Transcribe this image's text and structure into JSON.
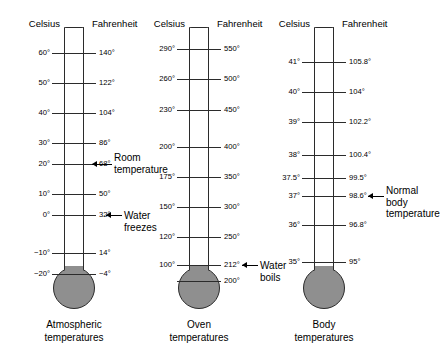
{
  "figure": {
    "colors": {
      "mercury": "#8f8f8f",
      "outline": "#2b2b2b",
      "background": "#ffffff"
    }
  },
  "thermometers": [
    {
      "id": "atmospheric",
      "caption_line1": "Atmospheric",
      "caption_line2": "temperatures",
      "header_celsius": "Celsius",
      "header_fahrenheit": "Fahrenheit",
      "ticks": [
        {
          "c": "60°",
          "f": "140°"
        },
        {
          "c": "50°",
          "f": "122°"
        },
        {
          "c": "40°",
          "f": "104°"
        },
        {
          "c": "30°",
          "f": "86°"
        },
        {
          "c": "20°",
          "f": "68°"
        },
        {
          "c": "10°",
          "f": "50°"
        },
        {
          "c": "0°",
          "f": "32°"
        },
        {
          "c": "−10°",
          "f": "14°"
        },
        {
          "c": "−20°",
          "f": "−4°"
        }
      ],
      "fill_to_tick_index": 6,
      "annotations": [
        {
          "id": "room-temperature",
          "lines": [
            "Room",
            "temperature"
          ],
          "at_tick_index": 4,
          "arrow": "left"
        },
        {
          "id": "water-freezes",
          "lines": [
            "Water",
            "freezes"
          ],
          "at_tick_index": 6,
          "arrow": "left"
        }
      ]
    },
    {
      "id": "oven",
      "caption_line1": "Oven",
      "caption_line2": "temperatures",
      "header_celsius": "Celsius",
      "header_fahrenheit": "Fahrenheit",
      "ticks": [
        {
          "c": "290°",
          "f": "550°"
        },
        {
          "c": "260°",
          "f": "500°"
        },
        {
          "c": "230°",
          "f": "450°"
        },
        {
          "c": "200°",
          "f": "400°"
        },
        {
          "c": "175°",
          "f": "350°"
        },
        {
          "c": "150°",
          "f": "300°"
        },
        {
          "c": "120°",
          "f": "250°"
        },
        {
          "c": "100°",
          "f": "212°"
        },
        {
          "c": "",
          "f": "200°"
        }
      ],
      "fill_to_tick_index": 7,
      "annotations": [
        {
          "id": "water-boils",
          "lines": [
            "Water",
            "boils"
          ],
          "at_tick_index": 7,
          "arrow": "left"
        }
      ]
    },
    {
      "id": "body",
      "caption_line1": "Body",
      "caption_line2": "temperatures",
      "header_celsius": "Celsius",
      "header_fahrenheit": "Fahrenheit",
      "ticks": [
        {
          "c": "41°",
          "f": "105.8°"
        },
        {
          "c": "40°",
          "f": "104°"
        },
        {
          "c": "39°",
          "f": "102.2°"
        },
        {
          "c": "38°",
          "f": "100.4°"
        },
        {
          "c": "37.5°",
          "f": "99.5°"
        },
        {
          "c": "37°",
          "f": "98.6°"
        },
        {
          "c": "36°",
          "f": "96.8°"
        },
        {
          "c": "35°",
          "f": "95°"
        }
      ],
      "fill_to_tick_index": 5,
      "annotations": [
        {
          "id": "normal-body-temperature",
          "lines": [
            "Normal",
            "body",
            "temperature"
          ],
          "at_tick_index": 5,
          "arrow": "left"
        }
      ]
    }
  ]
}
